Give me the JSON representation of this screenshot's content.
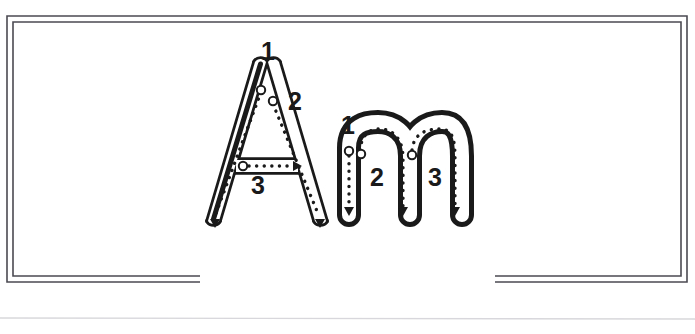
{
  "page": {
    "background_color": "#ffffff",
    "width": 695,
    "height": 334
  },
  "border": {
    "name": "double-line-frame",
    "color": "#4a4a52",
    "outer": {
      "x": 7,
      "y": 16,
      "width": 680,
      "height": 266
    },
    "inner": {
      "x": 13,
      "y": 22,
      "width": 668,
      "height": 254
    },
    "bottom_gap": {
      "start_x": 200,
      "end_x": 495
    },
    "stroke_width": 1.6
  },
  "page_rule": {
    "name": "page-bottom-rule",
    "color": "#d8d8dc",
    "y": 318
  },
  "letters": [
    {
      "id": "letter-a",
      "character": "A",
      "case": "uppercase",
      "outline_color": "#1a1a1a",
      "fill_color": "#ffffff",
      "guide_color": "#1a1a1a",
      "stroke_count": 3,
      "strokes": [
        {
          "number": "1",
          "label_x": 268,
          "label_y": 60,
          "start_dot_x": 261,
          "start_dot_y": 90,
          "description": "left diagonal down"
        },
        {
          "number": "2",
          "label_x": 292,
          "label_y": 98,
          "start_dot_x": 272,
          "start_dot_y": 102,
          "description": "right diagonal down"
        },
        {
          "number": "3",
          "label_x": 258,
          "label_y": 183,
          "start_dot_x": 243,
          "start_dot_y": 166,
          "description": "horizontal crossbar left to right"
        }
      ]
    },
    {
      "id": "letter-m",
      "character": "m",
      "case": "lowercase",
      "outline_color": "#1a1a1a",
      "fill_color": "#ffffff",
      "guide_color": "#1a1a1a",
      "stroke_count": 3,
      "strokes": [
        {
          "number": "1",
          "label_x": 348,
          "label_y": 126,
          "start_dot_x": 349,
          "start_dot_y": 151,
          "description": "left vertical stem down"
        },
        {
          "number": "2",
          "label_x": 376,
          "label_y": 176,
          "start_dot_x": 360,
          "start_dot_y": 154,
          "description": "first arch over and down"
        },
        {
          "number": "3",
          "label_x": 435,
          "label_y": 176,
          "start_dot_x": 411,
          "start_dot_y": 156,
          "description": "second arch over and down"
        }
      ]
    }
  ],
  "guides": {
    "dot_pattern": "dotted-tracing-path",
    "start_marker": "open-circle",
    "direction_marker": "solid-arrowhead"
  }
}
